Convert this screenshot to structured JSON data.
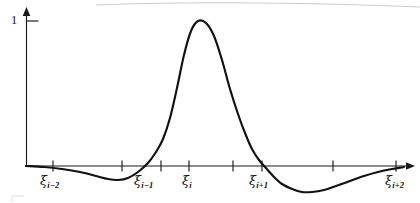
{
  "figure": {
    "background_color": "#ffffff",
    "curve_color": "#111111",
    "axis_color": "#1a1a1a",
    "width_px": 420,
    "height_px": 203
  },
  "axes": {
    "y_axis": {
      "arrow": "up",
      "unit_tick_label": "1",
      "label_name": "y-axis-unit-label"
    },
    "x_axis": {
      "arrow": "right",
      "baseline_value": 0
    }
  },
  "knots": [
    {
      "id": "xi-i-minus-2",
      "glyph": "ξ",
      "subscript": "i−2",
      "label": "ξᵢ₋₂",
      "x_px": 53
    },
    {
      "id": "xi-i-minus-1",
      "glyph": "ξ",
      "subscript": "i−1",
      "label": "ξᵢ₋₁",
      "x_px": 161
    },
    {
      "id": "xi-i",
      "glyph": "ξ",
      "subscript": "i",
      "label": "ξᵢ",
      "x_px": 189
    },
    {
      "id": "xi-i-plus-1",
      "glyph": "ξ",
      "subscript": "i+1",
      "label": "ξᵢ₊₁",
      "x_px": 262
    },
    {
      "id": "xi-i-plus-2",
      "glyph": "ξ",
      "subscript": "i+2",
      "label": "ξᵢ₊₂",
      "x_px": 396
    }
  ],
  "tick_positions_px": [
    53,
    122,
    161,
    189,
    233,
    262,
    333,
    396
  ],
  "chart_data": {
    "type": "line",
    "title": "",
    "xlabel": "",
    "ylabel": "",
    "grid": false,
    "legend": null,
    "ylim": [
      -0.25,
      1.08
    ],
    "xlim": [
      0,
      1
    ],
    "y_ticks": [
      1
    ],
    "y_tick_labels": [
      "1"
    ],
    "x_tick_labels": [
      "ξᵢ₋₂",
      "",
      "ξᵢ₋₁",
      "ξᵢ",
      "",
      "ξᵢ₊₁",
      "",
      "ξᵢ₊₂"
    ],
    "annotations": [
      {
        "text": "peak value 1 at ξᵢ",
        "x_px": 198,
        "y_value": 1.0
      },
      {
        "text": "left negative lobe minimum",
        "x_px": 110,
        "y_value": -0.11
      },
      {
        "text": "right negative lobe minimum",
        "x_px": 312,
        "y_value": -0.2
      }
    ],
    "series": [
      {
        "name": "cardinal basis function",
        "color": "#111111",
        "points_px": [
          [
            26,
            166
          ],
          [
            44,
            167
          ],
          [
            62,
            169
          ],
          [
            80,
            172
          ],
          [
            96,
            176
          ],
          [
            108,
            179
          ],
          [
            118,
            180
          ],
          [
            128,
            178
          ],
          [
            138,
            172
          ],
          [
            148,
            163
          ],
          [
            156,
            152
          ],
          [
            163,
            139
          ],
          [
            170,
            118
          ],
          [
            177,
            88
          ],
          [
            184,
            55
          ],
          [
            191,
            31
          ],
          [
            198,
            21
          ],
          [
            206,
            23
          ],
          [
            214,
            36
          ],
          [
            222,
            60
          ],
          [
            230,
            89
          ],
          [
            238,
            114
          ],
          [
            245,
            133
          ],
          [
            252,
            149
          ],
          [
            259,
            160
          ],
          [
            266,
            168
          ],
          [
            274,
            177
          ],
          [
            282,
            184
          ],
          [
            292,
            189
          ],
          [
            302,
            192
          ],
          [
            312,
            192
          ],
          [
            324,
            190
          ],
          [
            336,
            186
          ],
          [
            350,
            181
          ],
          [
            364,
            176
          ],
          [
            378,
            172
          ],
          [
            392,
            169
          ],
          [
            404,
            167
          ]
        ]
      }
    ]
  }
}
